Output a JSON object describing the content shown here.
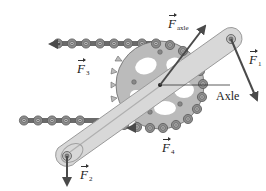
{
  "diagram": {
    "colors": {
      "arrow": "#4a4a4a",
      "chain_link": "#8a8a8a",
      "chain_plate": "#555555",
      "sprocket": "#b9b9b9",
      "crank": "#d6d6d6",
      "crank_outline": "#9a9a9a",
      "background": "#ffffff"
    },
    "labels": {
      "f_axle": {
        "symbol": "F",
        "subscript": "axle"
      },
      "f1": {
        "symbol": "F",
        "subscript": "1"
      },
      "f2": {
        "symbol": "F",
        "subscript": "2"
      },
      "f3": {
        "symbol": "F",
        "subscript": "3"
      },
      "f4": {
        "symbol": "F",
        "subscript": "4"
      },
      "axle": "Axle"
    },
    "forces": [
      {
        "name": "F_axle",
        "from": [
          160,
          85
        ],
        "to": [
          206,
          25
        ],
        "description": "force on axle, up-right"
      },
      {
        "name": "F1",
        "from": [
          231,
          39
        ],
        "to": [
          258,
          100
        ],
        "description": "pedal force on upper pedal, down-right"
      },
      {
        "name": "F2",
        "from": [
          67,
          156
        ],
        "to": [
          67,
          185
        ],
        "description": "force on lower pedal, downward"
      },
      {
        "name": "F3",
        "from": [
          70,
          44
        ],
        "to": [
          50,
          44
        ],
        "description": "upper chain tension, leftward"
      },
      {
        "name": "F4",
        "from": [
          150,
          128
        ],
        "to": [
          130,
          128
        ],
        "description": "lower chain tension, leftward"
      }
    ],
    "components": [
      "chain (upper strand)",
      "chain (lower strand)",
      "chainring sprocket",
      "crank arm",
      "pedal spindle upper",
      "pedal spindle lower",
      "axle"
    ]
  }
}
